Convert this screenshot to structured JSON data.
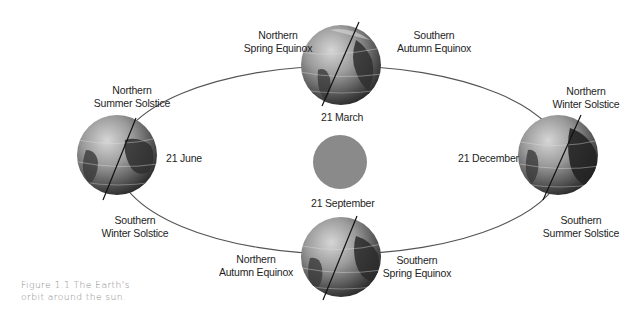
{
  "figure": {
    "caption_line1": "Figure 1.1 The Earth's",
    "caption_line2": "orbit around the sun."
  },
  "colors": {
    "background": "#ffffff",
    "orbit": "#555555",
    "sun": "#8a8a8a",
    "globe_light": "#bdbdbd",
    "globe_dark": "#3a3a3a",
    "axis": "#111111",
    "label_text": "#1e1e1e",
    "caption_text": "#8a8a8a"
  },
  "sun": {
    "label": "sun"
  },
  "positions": [
    {
      "id": "top",
      "date": "21 March",
      "north_label_1": "Northern",
      "north_label_2": "Spring Equinox",
      "south_label_1": "Southern",
      "south_label_2": "Autumn Equinox"
    },
    {
      "id": "left",
      "date": "21 June",
      "north_label_1": "Northern",
      "north_label_2": "Summer Solstice",
      "south_label_1": "Southern",
      "south_label_2": "Winter Solstice"
    },
    {
      "id": "right",
      "date": "21 December",
      "north_label_1": "Northern",
      "north_label_2": "Winter Solstice",
      "south_label_1": "Southern",
      "south_label_2": "Summer Solstice"
    },
    {
      "id": "bottom",
      "date": "21 September",
      "north_label_1": "Northern",
      "north_label_2": "Autumn Equinox",
      "south_label_1": "Southern",
      "south_label_2": "Spring Equinox"
    }
  ]
}
